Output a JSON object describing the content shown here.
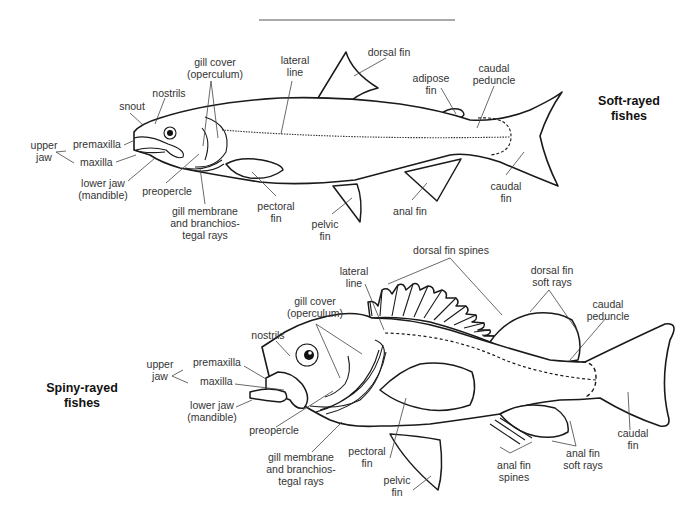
{
  "soft_rayed": {
    "title_line1": "Soft-rayed",
    "title_line2": "fishes",
    "labels": {
      "snout": "snout",
      "nostrils": "nostrils",
      "gill_cover_1": "gill cover",
      "gill_cover_2": "(operculum)",
      "lateral_line_1": "lateral",
      "lateral_line_2": "line",
      "dorsal_fin": "dorsal fin",
      "adipose_fin_1": "adipose",
      "adipose_fin_2": "fin",
      "caudal_peduncle_1": "caudal",
      "caudal_peduncle_2": "peduncle",
      "upper_jaw_1": "upper",
      "upper_jaw_2": "jaw",
      "premaxilla": "premaxilla",
      "maxilla": "maxilla",
      "lower_jaw_1": "lower jaw",
      "lower_jaw_2": "(mandible)",
      "preopercle": "preopercle",
      "gill_membrane_1": "gill membrane",
      "gill_membrane_2": "and branchios-",
      "gill_membrane_3": "tegal rays",
      "pectoral_fin_1": "pectoral",
      "pectoral_fin_2": "fin",
      "pelvic_fin_1": "pelvic",
      "pelvic_fin_2": "fin",
      "anal_fin": "anal fin",
      "caudal_fin_1": "caudal",
      "caudal_fin_2": "fin"
    }
  },
  "spiny_rayed": {
    "title_line1": "Spiny-rayed",
    "title_line2": "fishes",
    "labels": {
      "dorsal_fin_spines": "dorsal fin spines",
      "lateral_line_1": "lateral",
      "lateral_line_2": "line",
      "dorsal_soft_rays_1": "dorsal fin",
      "dorsal_soft_rays_2": "soft rays",
      "caudal_peduncle_1": "caudal",
      "caudal_peduncle_2": "peduncle",
      "gill_cover_1": "gill cover",
      "gill_cover_2": "(operculum)",
      "nostrils": "nostrils",
      "upper_jaw_1": "upper",
      "upper_jaw_2": "jaw",
      "premaxilla": "premaxilla",
      "maxilla": "maxilla",
      "lower_jaw_1": "lower jaw",
      "lower_jaw_2": "(mandible)",
      "preopercle": "preopercle",
      "gill_membrane_1": "gill membrane",
      "gill_membrane_2": "and branchios-",
      "gill_membrane_3": "tegal rays",
      "pectoral_fin_1": "pectoral",
      "pectoral_fin_2": "fin",
      "pelvic_fin_1": "pelvic",
      "pelvic_fin_2": "fin",
      "anal_fin_spines_1": "anal fin",
      "anal_fin_spines_2": "spines",
      "anal_soft_rays_1": "anal fin",
      "anal_soft_rays_2": "soft rays",
      "caudal_fin_1": "caudal",
      "caudal_fin_2": "fin"
    }
  }
}
